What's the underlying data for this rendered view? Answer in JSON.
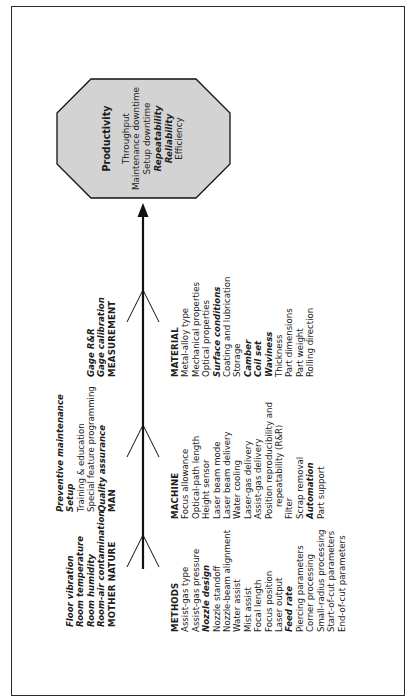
{
  "diagram": {
    "type": "fishbone",
    "orientation": "rotated-90-ccw",
    "colors": {
      "line": "#111111",
      "effect_fill": "#d3d3d3",
      "text": "#1c1c1c"
    },
    "effect": {
      "title": "Productivity",
      "items": [
        {
          "label": "Throughput",
          "emphasis": false
        },
        {
          "label": "Maintenance downtime",
          "emphasis": false
        },
        {
          "label": "Setup downtime",
          "emphasis": false
        },
        {
          "label": "Repeatability",
          "emphasis": true
        },
        {
          "label": "Reliability",
          "emphasis": true
        },
        {
          "label": "Efficiency",
          "emphasis": false
        }
      ]
    },
    "upper_categories": {
      "mother_nature": {
        "name": "MOTHER NATURE",
        "items": [
          {
            "label": "Floor vibration",
            "emphasis": true
          },
          {
            "label": "Room temperature",
            "emphasis": true
          },
          {
            "label": "Room humidity",
            "emphasis": true
          },
          {
            "label": "Room-air contamination",
            "emphasis": true
          }
        ]
      },
      "man": {
        "name": "MAN",
        "items": [
          {
            "label": "Preventive maintenance",
            "emphasis": true
          },
          {
            "label": "Setup",
            "emphasis": true
          },
          {
            "label": "Training & education",
            "emphasis": false
          },
          {
            "label": "Special feature programming",
            "emphasis": false
          },
          {
            "label": "Quality assurance",
            "emphasis": true
          }
        ]
      },
      "measurement": {
        "name": "MEASUREMENT",
        "items": [
          {
            "label": "Gage R&R",
            "emphasis": true
          },
          {
            "label": "Gage calibration",
            "emphasis": true
          }
        ]
      }
    },
    "lower_categories": {
      "methods": {
        "name": "METHODS",
        "items": [
          {
            "label": "Assist-gas type",
            "emphasis": false
          },
          {
            "label": "Assist-gas pressure",
            "emphasis": false
          },
          {
            "label": "Nozzle design",
            "emphasis": true
          },
          {
            "label": "Nozzle standoff",
            "emphasis": false
          },
          {
            "label": "Nozzle-beam alignment",
            "emphasis": false
          },
          {
            "label": "Water assist",
            "emphasis": false
          },
          {
            "label": "Mist assist",
            "emphasis": false
          },
          {
            "label": "Focal length",
            "emphasis": false
          },
          {
            "label": "Focus position",
            "emphasis": false
          },
          {
            "label": "Laser output",
            "emphasis": false
          },
          {
            "label": "Feed rate",
            "emphasis": true
          },
          {
            "label": "Piercing parameters",
            "emphasis": false
          },
          {
            "label": "Corner processing",
            "emphasis": false
          },
          {
            "label": "Small-radius processing",
            "emphasis": false
          },
          {
            "label": "Start-of-cut parameters",
            "emphasis": false
          },
          {
            "label": "End-of-cut parameters",
            "emphasis": false
          }
        ]
      },
      "machine": {
        "name": "MACHINE",
        "items": [
          {
            "label": "Focus allowance",
            "emphasis": false
          },
          {
            "label": "Optical-path length",
            "emphasis": false
          },
          {
            "label": "Height sensor",
            "emphasis": false
          },
          {
            "label": "Laser beam mode",
            "emphasis": false
          },
          {
            "label": "Laser beam delivery",
            "emphasis": false
          },
          {
            "label": "Water cooling",
            "emphasis": false
          },
          {
            "label": "Laser-gas delivery",
            "emphasis": false
          },
          {
            "label": "Assist-gas delivery",
            "emphasis": false
          },
          {
            "label": "Position reproducibility and",
            "emphasis": false
          },
          {
            "label": "repeatability (R&R)",
            "emphasis": false,
            "indent": true
          },
          {
            "label": "Filter",
            "emphasis": false
          },
          {
            "label": "Scrap removal",
            "emphasis": false
          },
          {
            "label": "Automation",
            "emphasis": true
          },
          {
            "label": "Part support",
            "emphasis": false
          }
        ]
      },
      "material": {
        "name": "MATERIAL",
        "items": [
          {
            "label": "Metal-alloy type",
            "emphasis": false
          },
          {
            "label": "Mechanical properties",
            "emphasis": false
          },
          {
            "label": "Optical properties",
            "emphasis": false
          },
          {
            "label": "Surface conditions",
            "emphasis": true
          },
          {
            "label": "Coating and lubrication",
            "emphasis": false
          },
          {
            "label": "Storage",
            "emphasis": false
          },
          {
            "label": "Camber",
            "emphasis": true
          },
          {
            "label": "Coil set",
            "emphasis": true
          },
          {
            "label": "Waviness",
            "emphasis": true
          },
          {
            "label": "Thickness",
            "emphasis": false
          },
          {
            "label": "Part dimensions",
            "emphasis": false
          },
          {
            "label": "Part weight",
            "emphasis": false
          },
          {
            "label": "Rolling direction",
            "emphasis": false
          }
        ]
      }
    }
  }
}
